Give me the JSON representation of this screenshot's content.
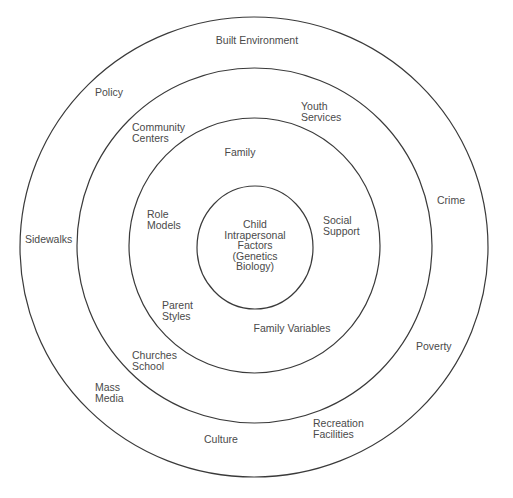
{
  "diagram": {
    "type": "concentric-circles",
    "colors": {
      "stroke": "#3a3a3a",
      "text": "#4a4a4a",
      "background": "#ffffff"
    },
    "rings": [
      {
        "level": 1,
        "name": "core",
        "cx": 255,
        "cy": 247.5,
        "rx": 58,
        "ry": 61.5
      },
      {
        "level": 2,
        "name": "family",
        "cx": 254.5,
        "cy": 245.5,
        "rx": 125.5,
        "ry": 127.5
      },
      {
        "level": 3,
        "name": "community",
        "cx": 254.5,
        "cy": 245.5,
        "rx": 177.5,
        "ry": 177.5
      },
      {
        "level": 4,
        "name": "environment",
        "cx": 254,
        "cy": 247,
        "rx": 234,
        "ry": 230
      }
    ],
    "labels": {
      "core": "Child\nIntrapersonal\nFactors\n(Genetics\nBiology)",
      "family": "Family",
      "role_models": "Role\nModels",
      "social_support": "Social\nSupport",
      "parent_styles": "Parent\nStyles",
      "family_variables": "Family Variables",
      "community_centers": "Community\nCenters",
      "youth_services": "Youth\nServices",
      "churches_school": "Churches\nSchool",
      "recreation_facilities": "Recreation\nFacilities",
      "built_environment": "Built Environment",
      "policy": "Policy",
      "crime": "Crime",
      "sidewalks": "Sidewalks",
      "poverty": "Poverty",
      "mass_media": "Mass\nMedia",
      "culture": "Culture"
    }
  }
}
